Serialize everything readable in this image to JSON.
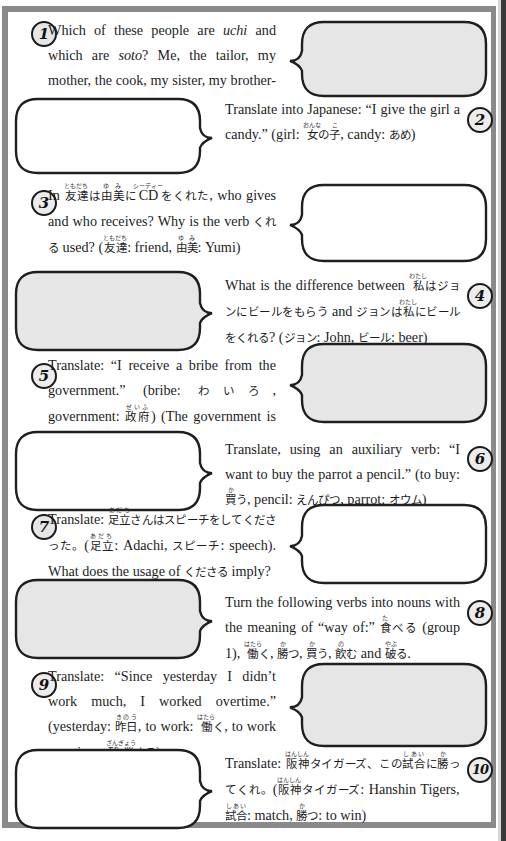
{
  "exercises": [
    {
      "number": "1",
      "bubble": {
        "side": "right",
        "fill": "#e6e6e6"
      },
      "segments": [
        {
          "t": "Which of these people are "
        },
        {
          "t": "uchi",
          "i": true
        },
        {
          "t": " and which are "
        },
        {
          "t": "soto",
          "i": true
        },
        {
          "t": "? Me, the tailor, my mother, the cook, my sister, my brother-in-law."
        }
      ]
    },
    {
      "number": "2",
      "bubble": {
        "side": "left",
        "fill": "#ffffff"
      },
      "segments": [
        {
          "t": "Translate into Japanese: “I give the girl a candy.” (girl: "
        },
        {
          "jp": "女",
          "rt": "おんな"
        },
        {
          "jp": "の"
        },
        {
          "jp": "子",
          "rt": "こ"
        },
        {
          "t": ", candy: "
        },
        {
          "jp": "あめ"
        },
        {
          "t": ")"
        }
      ]
    },
    {
      "number": "3",
      "bubble": {
        "side": "right",
        "fill": "#ffffff"
      },
      "segments": [
        {
          "t": "In "
        },
        {
          "jp": "友達",
          "rt": "ともだち"
        },
        {
          "jp": "は"
        },
        {
          "jp": "由美",
          "rt": "ゆみ"
        },
        {
          "jp": "に"
        },
        {
          "t": "CD",
          "rt": "シーディー"
        },
        {
          "jp": "をくれた"
        },
        {
          "t": ", who gives and who receives? Why is the verb "
        },
        {
          "jp": "くれる"
        },
        {
          "t": " used? ("
        },
        {
          "jp": "友達",
          "rt": "ともだち"
        },
        {
          "t": ": friend, "
        },
        {
          "jp": "由美",
          "rt": "ゆみ"
        },
        {
          "t": ": Yumi)"
        }
      ]
    },
    {
      "number": "4",
      "bubble": {
        "side": "left",
        "fill": "#e6e6e6"
      },
      "segments": [
        {
          "t": "What is the difference between "
        },
        {
          "jp": "私",
          "rt": "わたし"
        },
        {
          "jp": "はジョンにビールをもらう"
        },
        {
          "t": " and "
        },
        {
          "jp": "ジョンは"
        },
        {
          "jp": "私",
          "rt": "わたし"
        },
        {
          "jp": "にビールをくれる"
        },
        {
          "t": "? ("
        },
        {
          "jp": "ジョン"
        },
        {
          "t": ": John, "
        },
        {
          "jp": "ビール"
        },
        {
          "t": ": beer)"
        }
      ]
    },
    {
      "number": "5",
      "bubble": {
        "side": "right",
        "fill": "#e6e6e6"
      },
      "segments": [
        {
          "t": "Translate: “I receive a bribe from the government.” (bribe: "
        },
        {
          "jp": "わいろ"
        },
        {
          "t": ", government: "
        },
        {
          "jp": "政府",
          "rt": "せいふ"
        },
        {
          "t": ") (The government is superior.)"
        }
      ]
    },
    {
      "number": "6",
      "bubble": {
        "side": "left",
        "fill": "#ffffff"
      },
      "segments": [
        {
          "t": "Translate, using an auxiliary verb: “I want to buy the parrot a pencil.” (to buy: "
        },
        {
          "jp": "買",
          "rt": "か"
        },
        {
          "jp": "う"
        },
        {
          "t": ", pencil: "
        },
        {
          "jp": "えんぴつ"
        },
        {
          "t": ", parrot: "
        },
        {
          "jp": "オウム"
        },
        {
          "t": ")"
        }
      ]
    },
    {
      "number": "7",
      "bubble": {
        "side": "right",
        "fill": "#ffffff"
      },
      "segments": [
        {
          "t": "Translate: "
        },
        {
          "jp": "足立",
          "rt": "あだち"
        },
        {
          "jp": "さんはスピーチをしてくださった。"
        },
        {
          "t": "("
        },
        {
          "jp": "足立",
          "rt": "あだち"
        },
        {
          "t": ": Adachi, "
        },
        {
          "jp": "スピーチ"
        },
        {
          "t": ": speech). What does the usage of "
        },
        {
          "jp": "くださる"
        },
        {
          "t": " imply?"
        }
      ]
    },
    {
      "number": "8",
      "bubble": {
        "side": "left",
        "fill": "#e6e6e6"
      },
      "segments": [
        {
          "t": "Turn the following verbs into nouns with the meaning of “way of:” "
        },
        {
          "jp": "食",
          "rt": "た"
        },
        {
          "jp": "べる"
        },
        {
          "t": " (group 1), "
        },
        {
          "jp": "働",
          "rt": "はたら"
        },
        {
          "jp": "く"
        },
        {
          "t": ", "
        },
        {
          "jp": "勝",
          "rt": "か"
        },
        {
          "jp": "つ"
        },
        {
          "t": ", "
        },
        {
          "jp": "買",
          "rt": "か"
        },
        {
          "jp": "う"
        },
        {
          "t": ", "
        },
        {
          "jp": "飲",
          "rt": "の"
        },
        {
          "jp": "む"
        },
        {
          "t": " and "
        },
        {
          "jp": "破",
          "rt": "やぶ"
        },
        {
          "jp": "る"
        },
        {
          "t": "."
        }
      ]
    },
    {
      "number": "9",
      "bubble": {
        "side": "right",
        "fill": "#e6e6e6"
      },
      "segments": [
        {
          "t": "Translate: “Since yesterday I didn’t work much, I worked overtime.” (yesterday: "
        },
        {
          "jp": "昨日",
          "rt": "きのう"
        },
        {
          "t": ", to work: "
        },
        {
          "jp": "働",
          "rt": "はたら"
        },
        {
          "jp": "く"
        },
        {
          "t": ", to work overtime: "
        },
        {
          "jp": "残業",
          "rt": "ざんぎょう"
        },
        {
          "jp": "する"
        },
        {
          "t": ")"
        }
      ]
    },
    {
      "number": "10",
      "bubble": {
        "side": "left",
        "fill": "#ffffff"
      },
      "segments": [
        {
          "t": "Translate: "
        },
        {
          "jp": "阪神",
          "rt": "はんしん"
        },
        {
          "jp": "タイガーズ、この"
        },
        {
          "jp": "試合",
          "rt": "しあい"
        },
        {
          "jp": "に"
        },
        {
          "jp": "勝",
          "rt": "か"
        },
        {
          "jp": "ってくれ。"
        },
        {
          "t": "("
        },
        {
          "jp": "阪神",
          "rt": "はんしん"
        },
        {
          "jp": "タイガーズ"
        },
        {
          "t": ": Hanshin Tigers, "
        },
        {
          "jp": "試合",
          "rt": "しあい"
        },
        {
          "t": ": match, "
        },
        {
          "jp": "勝",
          "rt": "か"
        },
        {
          "jp": "つ"
        },
        {
          "t": ": to win)"
        }
      ]
    }
  ],
  "layout": [
    {
      "top": 18,
      "num": [
        31,
        21
      ],
      "txt": [
        48,
        18,
        228
      ],
      "bub": [
        288,
        20,
        200,
        78
      ]
    },
    {
      "top": 95,
      "num": [
        467,
        107
      ],
      "txt": [
        225,
        97,
        235
      ],
      "bub": [
        14,
        97,
        200,
        78
      ]
    },
    {
      "top": 180,
      "num": [
        31,
        190
      ],
      "txt": [
        48,
        182,
        228
      ],
      "bub": [
        288,
        183,
        200,
        80
      ]
    },
    {
      "top": 268,
      "num": [
        467,
        283
      ],
      "txt": [
        225,
        272,
        235
      ],
      "bub": [
        14,
        270,
        200,
        82
      ]
    },
    {
      "top": 355,
      "num": [
        31,
        363
      ],
      "txt": [
        48,
        353,
        228
      ],
      "bub": [
        288,
        342,
        200,
        82
      ]
    },
    {
      "top": 430,
      "num": [
        467,
        446
      ],
      "txt": [
        225,
        437,
        235
      ],
      "bub": [
        14,
        430,
        200,
        82
      ]
    },
    {
      "top": 515,
      "num": [
        31,
        514
      ],
      "txt": [
        48,
        506,
        228
      ],
      "bub": [
        288,
        503,
        200,
        82
      ]
    },
    {
      "top": 590,
      "num": [
        467,
        600
      ],
      "txt": [
        225,
        590,
        235
      ],
      "bub": [
        14,
        578,
        200,
        82
      ]
    },
    {
      "top": 665,
      "num": [
        31,
        672
      ],
      "txt": [
        48,
        664,
        228
      ],
      "bub": [
        288,
        662,
        200,
        86
      ]
    },
    {
      "top": 750,
      "num": [
        467,
        757
      ],
      "txt": [
        225,
        750,
        235
      ],
      "bub": [
        14,
        748,
        200,
        82
      ]
    }
  ]
}
